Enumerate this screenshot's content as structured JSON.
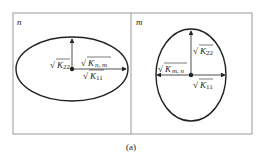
{
  "panels": [
    {
      "label": "n",
      "ellipse": {
        "cx": 72,
        "cy": 69,
        "rx": 56,
        "ry": 32
      },
      "labels": {
        "k22": "K",
        "k22_sub": "22",
        "knm": "K",
        "knm_sub": "n, m",
        "k11": "K",
        "k11_sub": "11"
      }
    },
    {
      "label": "m",
      "ellipse": {
        "cx": 191,
        "cy": 75,
        "rx": 35,
        "ry": 46
      },
      "labels": {
        "k22": "K",
        "k22_sub": "22",
        "kmn": "K",
        "kmn_sub": "m, n",
        "k11": "K",
        "k11_sub": "11"
      }
    }
  ],
  "caption": "(a)",
  "colors": {
    "stroke": "#222222",
    "frame": "#9a9a9a"
  }
}
